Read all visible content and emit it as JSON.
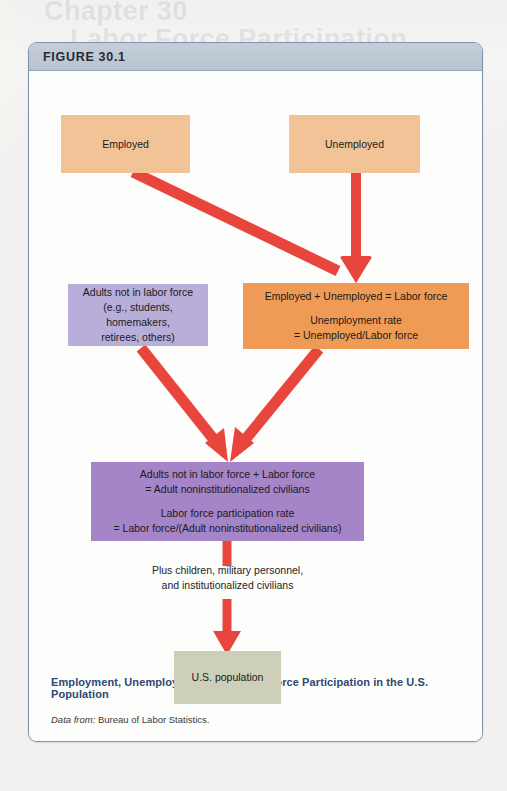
{
  "page": {
    "background_color": "#f2f1ef",
    "bleed_text": {
      "line1": "Chapter 30",
      "line2": "Labor Force Participation"
    }
  },
  "figure": {
    "number_label": "FIGURE 30.1",
    "caption": "Employment, Unemployment, and Labor Force Participation in the  U.S. Population",
    "source_lead": "Data from:",
    "source_text": " Bureau of Labor Statistics.",
    "frame_border_color": "#7e93ab",
    "header_color": "#bdc7d3"
  },
  "diagram": {
    "type": "flowchart",
    "arrow_color": "#e8453c",
    "nodes": [
      {
        "id": "employed",
        "label": "Employed",
        "color": "#f2c396",
        "lines": [
          "Employed"
        ]
      },
      {
        "id": "unemployed",
        "label": "Unemployed",
        "color": "#f2c396",
        "lines": [
          "Unemployed"
        ]
      },
      {
        "id": "not-in-labor-force",
        "label": "Adults not in labor force",
        "color": "#b9aeda",
        "lines": [
          "Adults not in labor force",
          "(e.g., students, homemakers,",
          "retirees, others)"
        ]
      },
      {
        "id": "labor-force",
        "label": "Labor force",
        "color": "#ef9b55",
        "lines_top": [
          "Employed + Unemployed = Labor force"
        ],
        "lines_bottom": [
          "Unemployment rate",
          "= Unemployed/Labor force"
        ]
      },
      {
        "id": "adult-noninstitutionalized-civilians",
        "label": "Adult noninstitutionalized civilians",
        "color": "#a584c8",
        "lines_top": [
          "Adults not in labor force + Labor force",
          "= Adult noninstitutionalized civilians"
        ],
        "lines_bottom": [
          "Labor force participation rate",
          "= Labor force/(Adult noninstitutionalized civilians)"
        ]
      },
      {
        "id": "us-population",
        "label": "U.S. population",
        "color": "#cdcfb8",
        "lines": [
          "U.S. population"
        ]
      }
    ],
    "connector_note": {
      "line1": "Plus children, military personnel,",
      "line2": "and institutionalized civilians"
    },
    "edges": [
      {
        "from": "employed",
        "to": "labor-force"
      },
      {
        "from": "unemployed",
        "to": "labor-force"
      },
      {
        "from": "not-in-labor-force",
        "to": "adult-noninstitutionalized-civilians"
      },
      {
        "from": "labor-force",
        "to": "adult-noninstitutionalized-civilians"
      },
      {
        "from": "adult-noninstitutionalized-civilians",
        "to": "us-population"
      }
    ]
  }
}
